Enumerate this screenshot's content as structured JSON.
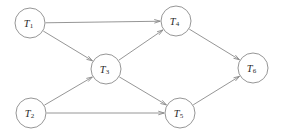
{
  "figure": {
    "type": "directed-graph",
    "background_color": "#ffffff",
    "line_color": "#8a8a8a",
    "label_color": "#2b2b2b",
    "node_fill": "#ffffff",
    "node_radius": 15
  },
  "nodes": [
    {
      "id": "T1",
      "label": "T",
      "subscript": "1",
      "cx": 30,
      "cy": 23
    },
    {
      "id": "T2",
      "label": "T",
      "subscript": "2",
      "cx": 31,
      "cy": 113
    },
    {
      "id": "T3",
      "label": "T",
      "subscript": "3",
      "cx": 106,
      "cy": 69
    },
    {
      "id": "T4",
      "label": "T",
      "subscript": "4",
      "cx": 176,
      "cy": 21
    },
    {
      "id": "T5",
      "label": "T",
      "subscript": "5",
      "cx": 180,
      "cy": 113
    },
    {
      "id": "T6",
      "label": "T",
      "subscript": "6",
      "cx": 253,
      "cy": 68
    }
  ],
  "edges": [
    {
      "id": "e1",
      "from": "T1",
      "to": "T4"
    },
    {
      "id": "e2",
      "from": "T1",
      "to": "T3"
    },
    {
      "id": "e3",
      "from": "T2",
      "to": "T3"
    },
    {
      "id": "e4",
      "from": "T2",
      "to": "T5"
    },
    {
      "id": "e5",
      "from": "T3",
      "to": "T4"
    },
    {
      "id": "e6",
      "from": "T3",
      "to": "T5"
    },
    {
      "id": "e7",
      "from": "T4",
      "to": "T6"
    },
    {
      "id": "e8",
      "from": "T5",
      "to": "T6"
    }
  ]
}
